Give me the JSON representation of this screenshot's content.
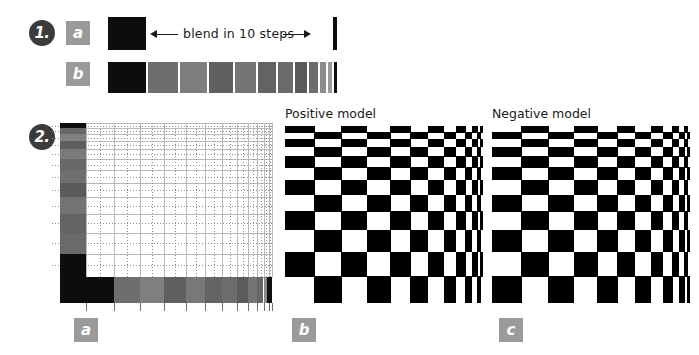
{
  "figure": {
    "background": "#ffffff",
    "ink": "#1a1a1a"
  },
  "steps": [
    {
      "marker": "1.",
      "name": "step-one"
    },
    {
      "marker": "2.",
      "name": "step-two"
    }
  ],
  "badges": {
    "row1a": "a",
    "row1b": "b",
    "panel2a": "a",
    "panel2b": "b",
    "panel2c": "c",
    "color": "#9a9a9a",
    "text_color": "#ffffff"
  },
  "blend": {
    "caption": "blend in 10 steps",
    "steps_count": 10,
    "start_color": "#000000",
    "end_color": "#000000",
    "mid_gray_min": "#555555",
    "mid_gray_max": "#8e8e8e",
    "source_swatch_color": "#0d0d0d",
    "target_bar_color": "#0d0d0d",
    "result_widths": [
      38,
      30,
      27,
      24,
      21,
      18,
      15,
      12,
      9,
      6,
      4,
      3
    ],
    "result_colors": [
      "#0d0d0d",
      "#6e6e6e",
      "#7d7d7d",
      "#5f5f5f",
      "#757575",
      "#636363",
      "#6a6a6a",
      "#5a5a5a",
      "#6d6d6d",
      "#8b8b8b",
      "#9a9a9a",
      "#101010"
    ]
  },
  "panels": {
    "positive": {
      "title": "Positive model",
      "label": "b",
      "type": "checkerboard",
      "inverted": false
    },
    "negative": {
      "title": "Negative model",
      "label": "c",
      "type": "checkerboard",
      "inverted": true
    },
    "gradient_grid": {
      "label": "a",
      "type": "perspective-grid",
      "left_column_colors": [
        "#0d0d0d",
        "#666666",
        "#808080",
        "#5e5e5e",
        "#7b7b7b",
        "#686868",
        "#6f6f6f",
        "#5b5b5b",
        "#737373",
        "#636363",
        "#6a6a6a",
        "#0d0d0d"
      ],
      "bottom_row_colors": [
        "#0d0d0d",
        "#6e6e6e",
        "#7f7f7f",
        "#5f5f5f",
        "#787878",
        "#646464",
        "#6d6d6d",
        "#5c5c5c",
        "#747474",
        "#666666",
        "#8a8a8a",
        "#101010"
      ],
      "grid_line_color": "#b9b9b9",
      "grid_dot_color": "#8d8d8d",
      "interior_color": "#ffffff"
    }
  },
  "checker_geometry": {
    "col_widths": [
      34,
      32,
      30,
      27,
      24,
      21,
      18,
      14,
      11,
      8,
      6,
      4,
      3
    ],
    "row_heights": [
      7,
      8,
      9,
      11,
      13,
      15,
      17,
      19,
      22,
      25,
      28,
      31
    ],
    "black": "#000000",
    "white": "#ffffff"
  }
}
